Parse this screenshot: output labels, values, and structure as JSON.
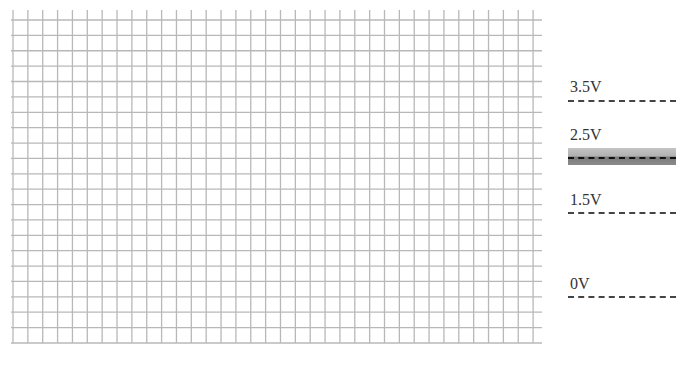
{
  "grid": {
    "origin_x": 13,
    "origin_y": 10,
    "first_hline_y": 20,
    "columns": 35,
    "rows": 21,
    "cell_width": 14.86,
    "cell_height": 15.38,
    "hline_left": 11,
    "hline_right": 542,
    "color": "#b8b8b8"
  },
  "levels": [
    {
      "label": "3.5V",
      "label_top": 79,
      "line_y": 101
    },
    {
      "label": "2.5V",
      "label_top": 127,
      "line_y": 158
    },
    {
      "label": "1.5V",
      "label_top": 192,
      "line_y": 213
    },
    {
      "label": "0V",
      "label_top": 276,
      "line_y": 297
    }
  ],
  "levels_x": 568,
  "levels_label_x": 570,
  "highlight_band": {
    "level": "2.5V",
    "top": 148,
    "bottom": 165,
    "color": "#b0b0b0"
  }
}
